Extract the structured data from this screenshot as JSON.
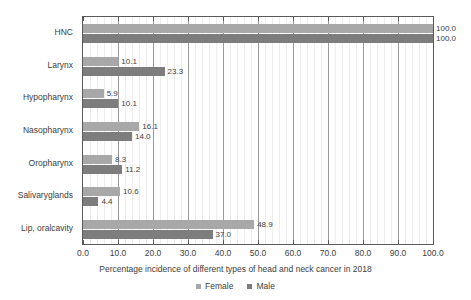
{
  "chart_data": {
    "type": "bar",
    "orientation": "horizontal",
    "title": "",
    "xlabel": "Percentage incidence of different types of head and neck cancer in 2018",
    "ylabel": "",
    "xlim": [
      0,
      100
    ],
    "xticks": [
      "0.0",
      "10.0",
      "20.0",
      "30.0",
      "40.0",
      "50.0",
      "60.0",
      "70.0",
      "80.0",
      "90.0",
      "100.0"
    ],
    "xtick_values": [
      0,
      10,
      20,
      30,
      40,
      50,
      60,
      70,
      80,
      90,
      100
    ],
    "grid": true,
    "minor_grid": true,
    "legend_position": "bottom",
    "categories": [
      "HNC",
      "Larynx",
      "Hypopharynx",
      "Nasopharynx",
      "Oropharynx",
      "Salivaryglands",
      "Lip, oralcavity"
    ],
    "series": [
      {
        "name": "Female",
        "color": "#a8a8a8",
        "values": [
          100.0,
          10.1,
          5.9,
          16.1,
          8.3,
          10.6,
          48.9
        ],
        "labels": [
          "100.0",
          "10.1",
          "5.9",
          "16.1",
          "8.3",
          "10.6",
          "48.9"
        ]
      },
      {
        "name": "Male",
        "color": "#7d7d7d",
        "values": [
          100.0,
          23.3,
          10.1,
          14.0,
          11.2,
          4.4,
          37.0
        ],
        "labels": [
          "100.0",
          "23.3",
          "10.1",
          "14.0",
          "11.2",
          "4.4",
          "37.0"
        ]
      }
    ]
  },
  "legend": {
    "items": [
      {
        "label": "Female",
        "color": "#a8a8a8"
      },
      {
        "label": "Male",
        "color": "#7d7d7d"
      }
    ]
  },
  "axis": {
    "title": "Percentage incidence of different types of head and neck cancer in 2018"
  }
}
